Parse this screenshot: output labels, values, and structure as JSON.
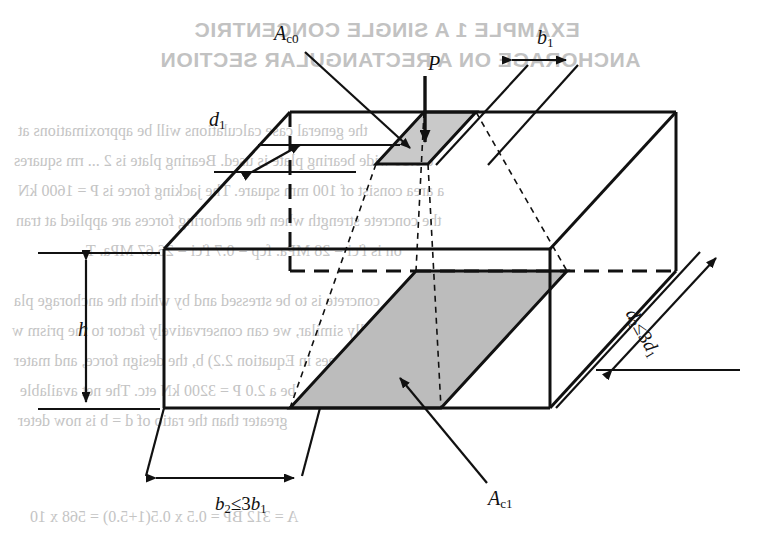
{
  "figure": {
    "title": "Single concentric anchorage on a rectangular section",
    "kind": "engineering-line-diagram",
    "colors": {
      "line": "#111111",
      "shade_top": "#c9c9c9",
      "shade_bottom": "#b8b8b8",
      "ghost_text": "#c2c2c2",
      "background": "#ffffff"
    },
    "labels": {
      "ac0": {
        "base": "A",
        "sub": "c0"
      },
      "ac1": {
        "base": "A",
        "sub": "c1"
      },
      "load": {
        "base": "P",
        "sub": ""
      },
      "b1": {
        "base": "b",
        "sub": "1"
      },
      "d1": {
        "base": "d",
        "sub": "1"
      },
      "h": {
        "base": "h",
        "sub": ""
      },
      "b2": {
        "lhs": "b",
        "lhs_sub": "2",
        "op": "≤",
        "coef": "3",
        "rhs": "b",
        "rhs_sub": "1"
      },
      "d2": {
        "lhs": "d",
        "lhs_sub": "2",
        "op": "≤",
        "coef": "3",
        "rhs": "d",
        "rhs_sub": "1"
      }
    },
    "annotations": [
      "A_c0 is the loaded area of the anchorage bearing plate on the top face",
      "A_c1 is the geometrically similar distributed area inside the member",
      "P is the concentrated anchorage force applied normal to the top face",
      "h is the height of the rectangular section",
      "b2 must not exceed three times b1",
      "d2 must not exceed three times d1"
    ]
  },
  "ghost": {
    "heading_line1": "EXAMPLE 1  A SINGLE CONCENTRIC",
    "heading_line2": "ANCHORAGE ON A RECTANGULAR SECTION",
    "body": [
      "the general case calculations will be approximations at",
      "e 0.16  wide  bearing plate is used. Bearing plate is 2 ... rm squares",
      "a area consist of 100 mm square. The jacking force is P = 1600 kN",
      "the concrete strength when the anchoring forces are applied at tran",
      "on is f'ci = 28 MPa. fcp = 0.7 f'ci = 26.67 MPa. T",
      "concrete is to be stressed and by which the anchorage pla",
      "ometrically similar, we can conservatively factor to the prism w",
      "b1. A = bd.  Agrees in Equation 2.2) b, the design force, and mater",
      "be a 2.0 P = 3200 kN etc. The net available",
      "greater than the ratio of d = b is now deter",
      "A = 312  BP = 0.5 x 0.5(1+5.0) = 568 x 10"
    ]
  }
}
